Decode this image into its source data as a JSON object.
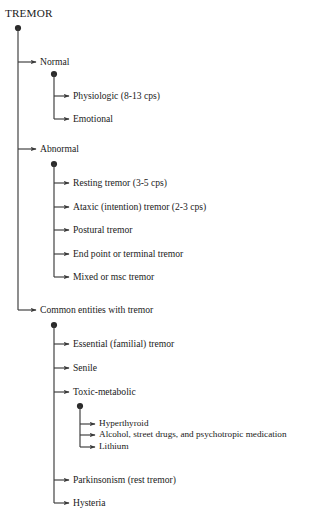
{
  "diagram": {
    "type": "tree",
    "title": "TREMOR",
    "title_pos": {
      "x": 5,
      "y": 8
    },
    "root_dot": {
      "x": 18,
      "y": 28
    },
    "colors": {
      "line": "#3a3a3a",
      "text": "#1a1a1a",
      "background": "#ffffff"
    },
    "branches": [
      {
        "id": "normal",
        "label": "Normal",
        "label_pos": {
          "x": 40,
          "y": 57
        },
        "arrow_y": 62,
        "trunk_x": 54,
        "dot": {
          "x": 54,
          "y": 74
        },
        "children": [
          {
            "id": "physiologic",
            "label": "Physiologic (8-13 cps)",
            "label_pos": {
              "x": 73,
              "y": 91
            },
            "arrow_y": 96
          },
          {
            "id": "emotional",
            "label": "Emotional",
            "label_pos": {
              "x": 73,
              "y": 114
            },
            "arrow_y": 119
          }
        ]
      },
      {
        "id": "abnormal",
        "label": "Abnormal",
        "label_pos": {
          "x": 40,
          "y": 144
        },
        "arrow_y": 149,
        "trunk_x": 54,
        "dot": {
          "x": 54,
          "y": 164
        },
        "children": [
          {
            "id": "resting-tremor",
            "label": "Resting tremor (3-5 cps)",
            "label_pos": {
              "x": 73,
              "y": 178
            },
            "arrow_y": 183
          },
          {
            "id": "ataxic-tremor",
            "label": "Ataxic (intention) tremor (2-3 cps)",
            "label_pos": {
              "x": 73,
              "y": 202
            },
            "arrow_y": 207
          },
          {
            "id": "postural-tremor",
            "label": "Postural tremor",
            "label_pos": {
              "x": 73,
              "y": 225
            },
            "arrow_y": 230
          },
          {
            "id": "end-point-tremor",
            "label": "End point or terminal tremor",
            "label_pos": {
              "x": 73,
              "y": 249
            },
            "arrow_y": 254
          },
          {
            "id": "mixed-tremor",
            "label": "Mixed or msc tremor",
            "label_pos": {
              "x": 73,
              "y": 272
            },
            "arrow_y": 277
          }
        ]
      },
      {
        "id": "common-entities",
        "label": "Common entities with tremor",
        "label_pos": {
          "x": 40,
          "y": 305
        },
        "arrow_y": 310,
        "trunk_x": 54,
        "dot": {
          "x": 54,
          "y": 325
        },
        "children": [
          {
            "id": "essential-tremor",
            "label": "Essential (familial) tremor",
            "label_pos": {
              "x": 73,
              "y": 339
            },
            "arrow_y": 344
          },
          {
            "id": "senile",
            "label": "Senile",
            "label_pos": {
              "x": 73,
              "y": 363
            },
            "arrow_y": 368
          },
          {
            "id": "toxic-metabolic",
            "label": "Toxic-metabolic",
            "label_pos": {
              "x": 73,
              "y": 387
            },
            "arrow_y": 392,
            "trunk_x": 80,
            "dot": {
              "x": 80,
              "y": 406
            },
            "children": [
              {
                "id": "hyperthyroid",
                "label": "Hyperthyroid",
                "label_pos": {
                  "x": 99,
                  "y": 419
                },
                "arrow_y": 424
              },
              {
                "id": "alcohol-drugs",
                "label": "Alcohol, street drugs, and psychotropic medication",
                "label_pos": {
                  "x": 99,
                  "y": 430
                },
                "arrow_y": 435
              },
              {
                "id": "lithium",
                "label": "Lithium",
                "label_pos": {
                  "x": 99,
                  "y": 442
                },
                "arrow_y": 447
              }
            ]
          },
          {
            "id": "parkinsonism",
            "label": "Parkinsonism (rest tremor)",
            "label_pos": {
              "x": 73,
              "y": 475
            },
            "arrow_y": 480
          },
          {
            "id": "hysteria",
            "label": "Hysteria",
            "label_pos": {
              "x": 73,
              "y": 498
            },
            "arrow_y": 503
          }
        ]
      }
    ]
  }
}
